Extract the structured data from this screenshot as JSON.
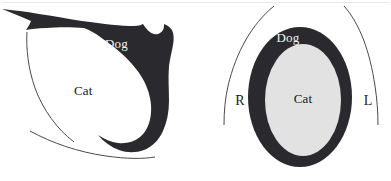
{
  "figure": {
    "title": "",
    "background_color": "#ffffff",
    "width": 391,
    "height": 181
  },
  "colors": {
    "dark_region": "#2a2a2e",
    "light_region": "#e2e2e2",
    "white_region": "#ffffff",
    "outline": "#3a3a3c",
    "label_on_dark": "#f2f2f2",
    "label_on_light": "#17171a"
  },
  "panels": [
    {
      "id": "left-panel",
      "name": "lateral-view",
      "labels": {
        "dark_label": "Dog",
        "light_label": "Cat"
      }
    },
    {
      "id": "right-panel",
      "name": "cross-section-view",
      "labels": {
        "dark_label": "Dog",
        "light_label": "Cat",
        "orientation_right": "R",
        "orientation_left": "L"
      }
    }
  ],
  "left_panel": {
    "dark_label": "Dog",
    "light_label": "Cat"
  },
  "right_panel": {
    "dark_label": "Dog",
    "light_label": "Cat",
    "orientation_right": "R",
    "orientation_left": "L"
  }
}
